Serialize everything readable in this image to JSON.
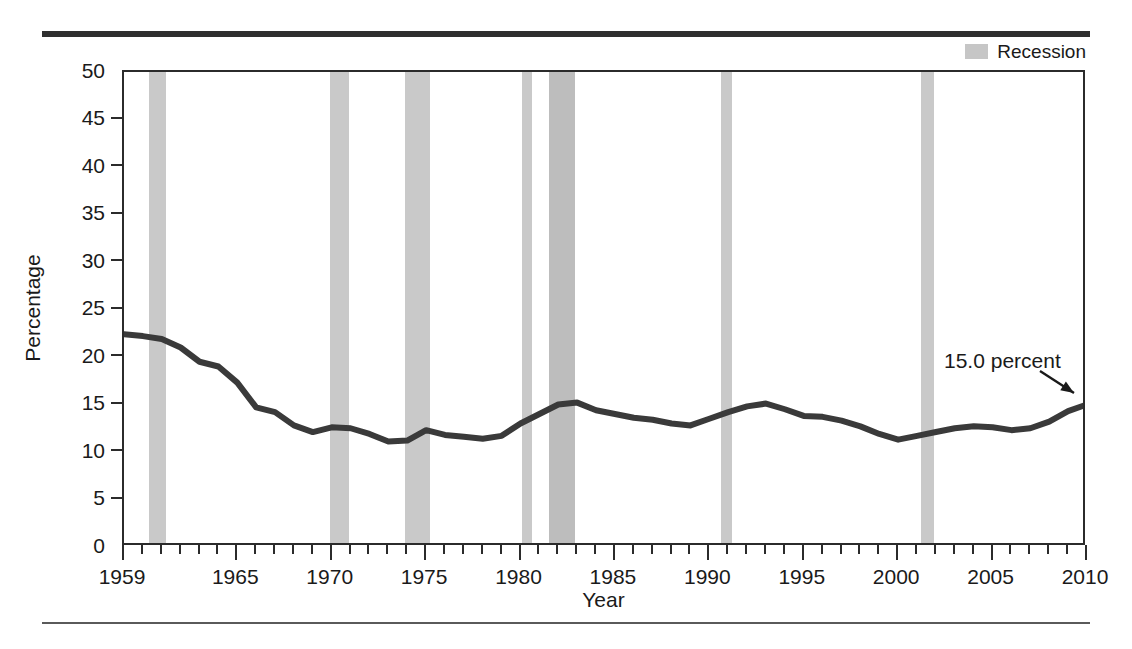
{
  "legend": {
    "swatch_name": "recession-swatch",
    "label": "Recession",
    "swatch_color": "#c6c6c6"
  },
  "annotation": {
    "text": "15.0 percent",
    "x_left": 944,
    "y_top": 349,
    "arrow_from_x": 1040,
    "arrow_from_y": 371,
    "arrow_to_x": 1074,
    "arrow_to_y": 393
  },
  "chart_data": {
    "type": "line",
    "title": "",
    "subtitle": "",
    "xlabel": "Year",
    "ylabel": "Percentage",
    "xlim": [
      1959,
      2010
    ],
    "ylim": [
      0,
      50
    ],
    "ytick_step": 5,
    "yticks": [
      0,
      5,
      10,
      15,
      20,
      25,
      30,
      35,
      40,
      45,
      50
    ],
    "xticks_major": [
      1959,
      1965,
      1970,
      1975,
      1980,
      1985,
      1990,
      1995,
      2000,
      2005,
      2010
    ],
    "xtick_minor_step": 1,
    "grid": false,
    "legend_position": "top-right",
    "line_color": "#3a3a3a",
    "line_width": 6,
    "series": [
      {
        "name": "Poverty rate",
        "x": [
          1959,
          1960,
          1961,
          1962,
          1963,
          1964,
          1965,
          1966,
          1967,
          1968,
          1969,
          1970,
          1971,
          1972,
          1973,
          1974,
          1975,
          1976,
          1977,
          1978,
          1979,
          1980,
          1981,
          1982,
          1983,
          1984,
          1985,
          1986,
          1987,
          1988,
          1989,
          1990,
          1991,
          1992,
          1993,
          1994,
          1995,
          1996,
          1997,
          1998,
          1999,
          2000,
          2001,
          2002,
          2003,
          2004,
          2005,
          2006,
          2007,
          2008,
          2009,
          2010
        ],
        "values": [
          22.4,
          22.2,
          21.9,
          21.0,
          19.5,
          19.0,
          17.3,
          14.7,
          14.2,
          12.8,
          12.1,
          12.6,
          12.5,
          11.9,
          11.1,
          11.2,
          12.3,
          11.8,
          11.6,
          11.4,
          11.7,
          13.0,
          14.0,
          15.0,
          15.2,
          14.4,
          14.0,
          13.6,
          13.4,
          13.0,
          12.8,
          13.5,
          14.2,
          14.8,
          15.1,
          14.5,
          13.8,
          13.7,
          13.3,
          12.7,
          11.9,
          11.3,
          11.7,
          12.1,
          12.5,
          12.7,
          12.6,
          12.3,
          12.5,
          13.2,
          14.3,
          15.0
        ]
      }
    ],
    "recession_bands": [
      {
        "start": 1960.3,
        "end": 1961.2,
        "shade": "light"
      },
      {
        "start": 1969.9,
        "end": 1970.9,
        "shade": "light"
      },
      {
        "start": 1973.9,
        "end": 1975.2,
        "shade": "light"
      },
      {
        "start": 1980.1,
        "end": 1980.6,
        "shade": "light"
      },
      {
        "start": 1981.5,
        "end": 1982.9,
        "shade": "dark"
      },
      {
        "start": 1990.6,
        "end": 1991.2,
        "shade": "light"
      },
      {
        "start": 2001.2,
        "end": 2001.9,
        "shade": "light"
      }
    ]
  }
}
